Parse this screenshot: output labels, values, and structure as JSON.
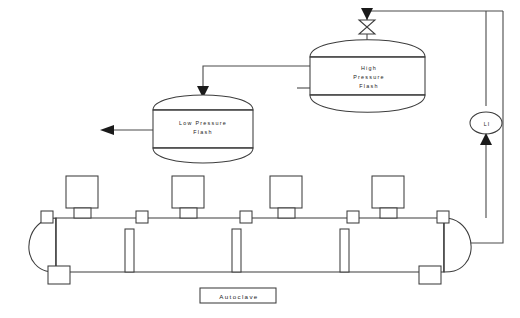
{
  "diagram": {
    "caption": "Autoclave",
    "vessels": [
      {
        "id": "low-pressure-flash",
        "label_line1": "Low Pressure",
        "label_line2": "Flash"
      },
      {
        "id": "high-pressure-flash",
        "label_line1": "High",
        "label_line2": "Pressure",
        "label_line3": "Flash"
      }
    ],
    "instruments": [
      {
        "id": "level-indicator",
        "tag": "LI"
      }
    ],
    "icons": {
      "valve": "control-valve-icon",
      "flow_arrow": "flow-arrow-icon",
      "agitator": "agitator-drive-icon",
      "nozzle": "nozzle-icon",
      "baffle": "internal-baffle-icon"
    },
    "colors": {
      "line": "#4a4a4a",
      "shape_stroke": "#3d3d3d",
      "fill": "#ffffff",
      "text": "#1a1a1a",
      "background": "#ffffff"
    },
    "counts": {
      "agitators": 4,
      "top_nozzles": 5,
      "bottom_nozzles": 2,
      "internal_baffles": 3
    }
  }
}
